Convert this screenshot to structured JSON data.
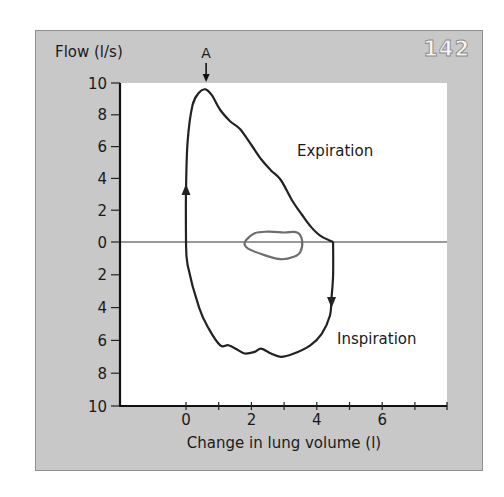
{
  "figure": {
    "number": "142",
    "panel_color": "#c8c8c8",
    "plot_color": "#ffffff",
    "loop_color": "#222222",
    "tidal_color": "#6e6e6e"
  },
  "chart_data": {
    "type": "line",
    "title": "",
    "xlabel": "Change in lung volume (l)",
    "ylabel": "Flow (l/s)",
    "xlim": [
      -2,
      8
    ],
    "ylim": [
      -10,
      10
    ],
    "x_ticks": [
      0,
      1,
      2,
      3,
      4,
      5,
      6,
      7
    ],
    "x_tick_labels": [
      "0",
      "2",
      "4",
      "6"
    ],
    "x_tick_label_values": [
      0,
      2,
      4,
      6
    ],
    "y_ticks": [
      10,
      8,
      6,
      4,
      2,
      0,
      -2,
      -4,
      -6,
      -8,
      -10
    ],
    "y_tick_labels": [
      "10",
      "8",
      "6",
      "4",
      "2",
      "0",
      "2",
      "4",
      "6",
      "8",
      "10"
    ],
    "grid": false,
    "zero_line": true,
    "annotations": [
      {
        "text": "A",
        "x": 0.6,
        "y": 9.6,
        "arrow": "down",
        "meaning": "peak expiratory flow"
      },
      {
        "text": "Expiration",
        "x": 3.4,
        "y": 5.5
      },
      {
        "text": "Inspiration",
        "x": 4.7,
        "y": -6.3
      }
    ],
    "series": [
      {
        "name": "Forced flow-volume loop (expiration)",
        "x": [
          0.0,
          0.0,
          0.05,
          0.2,
          0.4,
          0.6,
          0.8,
          1.05,
          1.35,
          1.65,
          2.0,
          2.3,
          2.6,
          2.9,
          3.25,
          3.55,
          3.8,
          4.1,
          4.5
        ],
        "y": [
          0.0,
          3.2,
          6.3,
          8.6,
          9.4,
          9.6,
          9.2,
          8.3,
          7.6,
          7.1,
          6.1,
          5.2,
          4.5,
          3.9,
          2.6,
          1.7,
          1.0,
          0.4,
          0.0
        ]
      },
      {
        "name": "Forced flow-volume loop (inspiration)",
        "x": [
          4.5,
          4.5,
          4.45,
          4.4,
          4.15,
          3.8,
          3.3,
          2.9,
          2.6,
          2.3,
          2.1,
          1.8,
          1.6,
          1.3,
          1.05,
          0.7,
          0.4,
          0.05,
          0.0
        ],
        "y": [
          0.0,
          -2.0,
          -3.4,
          -4.5,
          -5.6,
          -6.3,
          -6.8,
          -7.0,
          -6.8,
          -6.5,
          -6.7,
          -6.8,
          -6.6,
          -6.3,
          -6.3,
          -5.3,
          -4.0,
          -1.4,
          0.0
        ]
      },
      {
        "name": "Tidal breathing loop",
        "x": [
          1.8,
          2.1,
          2.5,
          3.0,
          3.4,
          3.55,
          3.5,
          3.3,
          2.9,
          2.4,
          1.9,
          1.8
        ],
        "y": [
          0.0,
          0.55,
          0.65,
          0.6,
          0.6,
          0.1,
          -0.6,
          -0.9,
          -1.05,
          -0.8,
          -0.4,
          0.0
        ]
      }
    ],
    "direction_arrows": [
      {
        "series": 0,
        "x": 0.0,
        "y": 3.2,
        "direction": "up"
      },
      {
        "series": 1,
        "x": 4.45,
        "y": -3.6,
        "direction": "down"
      }
    ]
  }
}
